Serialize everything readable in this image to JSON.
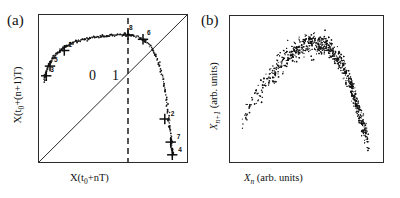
{
  "figure": {
    "panels": [
      {
        "id": "a",
        "label": "(a)",
        "xlabel_text": "X(t",
        "xlabel_sub": "0",
        "xlabel_tail": "+nT)",
        "ylabel_text": "X(t",
        "ylabel_sub": "0",
        "ylabel_tail": "+(n+1)T)",
        "symbols": [
          "0",
          "1"
        ],
        "marker_labels": [
          "1",
          "2",
          "3",
          "4",
          "5",
          "6",
          "7",
          "8"
        ],
        "has_diagonal": true,
        "has_dashed_partition": true
      },
      {
        "id": "b",
        "label": "(b)",
        "xlabel_text": "X",
        "xlabel_sub": "n",
        "xlabel_tail": " (arb. units)",
        "ylabel_text": "X",
        "ylabel_sub": "n+1",
        "ylabel_tail": " (arb. units)",
        "has_diagonal": false,
        "has_dashed_partition": false
      }
    ]
  },
  "chart_data": [
    {
      "type": "scatter",
      "panel": "a",
      "title": "",
      "xlabel": "X(t_0+nT)",
      "ylabel": "X(t_0+(n+1)T)",
      "xlim": [
        0,
        1
      ],
      "ylim": [
        0,
        1
      ],
      "grid": false,
      "legend": "none",
      "annotations": [
        "0",
        "1"
      ],
      "description": "First return map: single-humped (unimodal) branch of closely spaced points with eight cross markers labelled 1-8; dashed vertical partition line at x=0.60 separating symbolic regions 0 (left) and 1 (right); solid diagonal line y=x.",
      "partition_x": 0.6,
      "diagonal": {
        "x": [
          0,
          1
        ],
        "y": [
          0,
          1
        ]
      },
      "markers": [
        {
          "label": "1",
          "x": 0.175,
          "y": 0.755
        },
        {
          "label": "2",
          "x": 0.845,
          "y": 0.295
        },
        {
          "label": "3",
          "x": 0.055,
          "y": 0.585
        },
        {
          "label": "4",
          "x": 0.895,
          "y": 0.055
        },
        {
          "label": "5",
          "x": 0.08,
          "y": 0.65
        },
        {
          "label": "6",
          "x": 0.7,
          "y": 0.83
        },
        {
          "label": "7",
          "x": 0.885,
          "y": 0.14
        },
        {
          "label": "8",
          "x": 0.6,
          "y": 0.86
        }
      ],
      "curve_points_x": [
        0.04,
        0.048,
        0.056,
        0.065,
        0.075,
        0.086,
        0.098,
        0.111,
        0.125,
        0.14,
        0.156,
        0.173,
        0.191,
        0.21,
        0.23,
        0.251,
        0.273,
        0.296,
        0.32,
        0.345,
        0.371,
        0.398,
        0.426,
        0.455,
        0.485,
        0.516,
        0.548,
        0.581,
        0.61,
        0.638,
        0.665,
        0.691,
        0.716,
        0.74,
        0.762,
        0.782,
        0.8,
        0.816,
        0.83,
        0.842,
        0.852,
        0.861,
        0.868,
        0.874,
        0.879,
        0.884,
        0.888,
        0.892,
        0.896,
        0.9
      ],
      "curve_points_y": [
        0.555,
        0.585,
        0.612,
        0.637,
        0.66,
        0.681,
        0.7,
        0.718,
        0.734,
        0.749,
        0.762,
        0.774,
        0.785,
        0.795,
        0.804,
        0.812,
        0.819,
        0.826,
        0.832,
        0.838,
        0.843,
        0.847,
        0.851,
        0.854,
        0.857,
        0.859,
        0.86,
        0.86,
        0.858,
        0.853,
        0.845,
        0.833,
        0.816,
        0.793,
        0.763,
        0.726,
        0.682,
        0.632,
        0.578,
        0.521,
        0.462,
        0.403,
        0.345,
        0.289,
        0.236,
        0.187,
        0.143,
        0.105,
        0.075,
        0.052
      ]
    },
    {
      "type": "scatter",
      "panel": "b",
      "title": "",
      "xlabel": "X_n (arb. units)",
      "ylabel": "X_{n+1} (arb. units)",
      "xlim": [
        0,
        1
      ],
      "ylim": [
        0,
        1
      ],
      "grid": false,
      "legend": "none",
      "description": "Experimental first return map: dense cloud of ~1100 points forming a noisy single-humped (parabolic) band; sparse on the rising left flank, densest near the crest and on the steep descending right flank.",
      "n_points": 1100,
      "band_center_x": [
        0.09,
        0.15,
        0.22,
        0.29,
        0.36,
        0.43,
        0.5,
        0.57,
        0.63,
        0.69,
        0.74,
        0.79,
        0.83,
        0.87,
        0.9
      ],
      "band_center_y": [
        0.28,
        0.41,
        0.53,
        0.62,
        0.7,
        0.76,
        0.8,
        0.81,
        0.79,
        0.73,
        0.64,
        0.52,
        0.38,
        0.24,
        0.13
      ],
      "band_halfwidth": [
        0.05,
        0.06,
        0.07,
        0.08,
        0.08,
        0.08,
        0.08,
        0.07,
        0.07,
        0.06,
        0.06,
        0.06,
        0.06,
        0.06,
        0.05
      ],
      "band_density": [
        0.25,
        0.35,
        0.45,
        0.55,
        0.7,
        0.9,
        1.0,
        1.0,
        0.95,
        0.9,
        0.9,
        0.95,
        0.9,
        0.7,
        0.45
      ]
    }
  ]
}
